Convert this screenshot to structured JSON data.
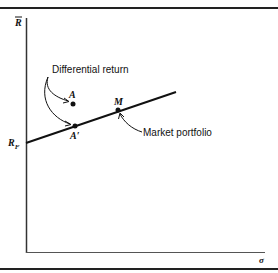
{
  "diagram": {
    "y_axis_label": "R",
    "x_axis_label": "σ",
    "intercept_label": "RF",
    "intercept_label_main": "R",
    "intercept_label_sub": "F",
    "points": {
      "A": "A",
      "A_prime": "A′",
      "M": "M"
    },
    "annotations": {
      "differential_return": "Differential return",
      "market_portfolio": "Market portfolio"
    }
  }
}
